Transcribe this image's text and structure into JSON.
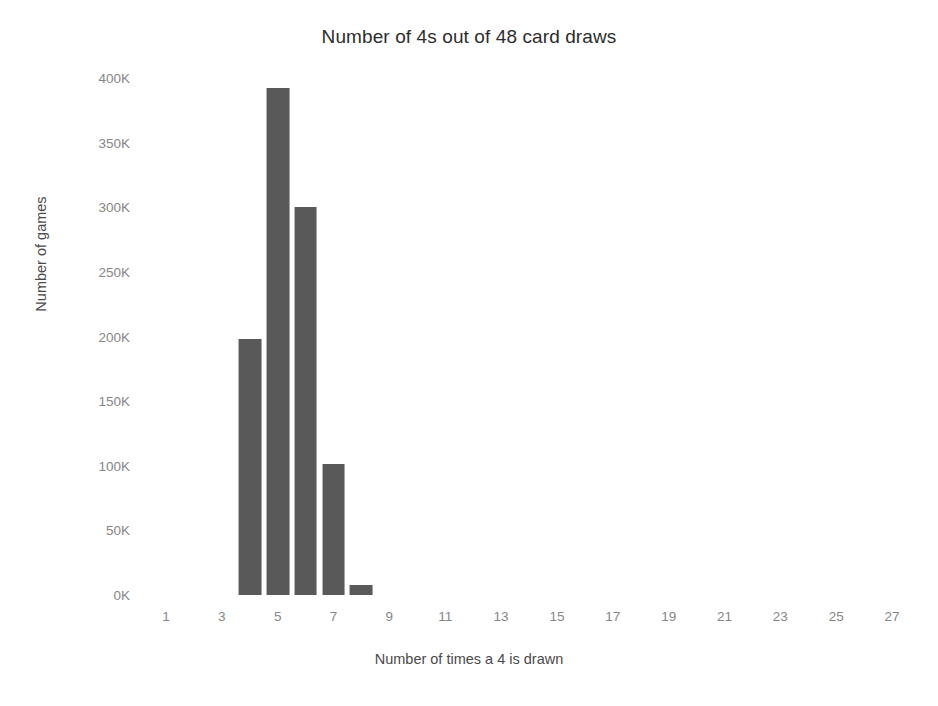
{
  "chart_data": {
    "type": "bar",
    "title": "Number of 4s out of 48 card draws",
    "xlabel": "Number of times a 4 is drawn",
    "ylabel": "Number of games",
    "grid": false,
    "legend": null,
    "xlim": [
      0,
      28
    ],
    "ylim": [
      0,
      400000
    ],
    "x_tick_labels": [
      "1",
      "3",
      "5",
      "7",
      "9",
      "11",
      "13",
      "15",
      "17",
      "19",
      "21",
      "23",
      "25",
      "27"
    ],
    "x_tick_values": [
      1,
      3,
      5,
      7,
      9,
      11,
      13,
      15,
      17,
      19,
      21,
      23,
      25,
      27
    ],
    "y_tick_labels": [
      "400K",
      "350K",
      "300K",
      "250K",
      "200K",
      "150K",
      "100K",
      "50K",
      "0K"
    ],
    "y_tick_values": [
      400000,
      350000,
      300000,
      250000,
      200000,
      150000,
      100000,
      50000,
      0
    ],
    "categories": [
      4,
      5,
      6,
      7,
      8
    ],
    "values": [
      198000,
      392000,
      300000,
      101000,
      8000
    ],
    "bar_color": "#595959",
    "background_color": "#ffffff"
  }
}
